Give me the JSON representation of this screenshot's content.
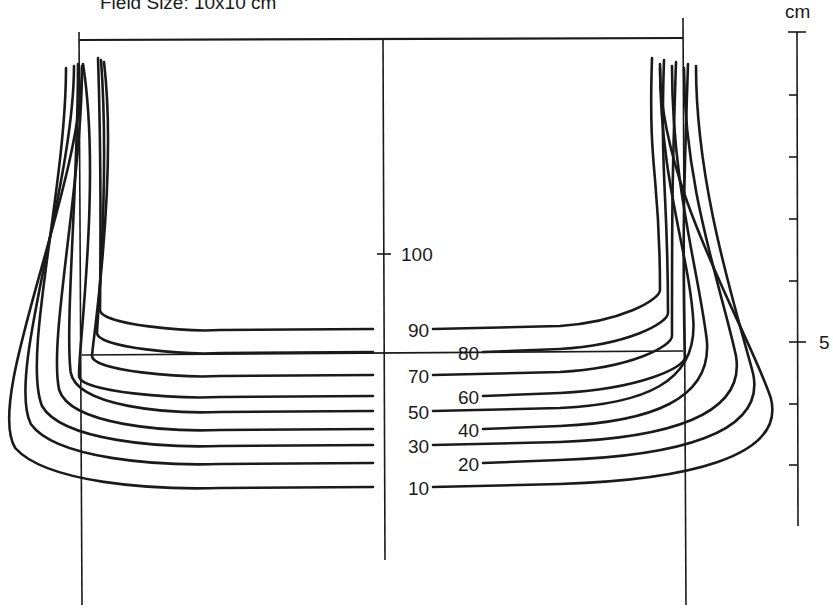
{
  "title": "Field Size:   10x10 cm",
  "scale": {
    "unit_label": "cm",
    "mark_label": "5",
    "x": 797,
    "y_top": 32,
    "y_bottom": 526,
    "ticks_y": [
      32,
      95,
      157,
      219,
      281,
      342,
      404,
      465
    ],
    "major_tick_y": 342
  },
  "central_axis": {
    "x": 383,
    "y_top": 40,
    "y_bottom": 560,
    "tick_y": 254,
    "tick_label": "100"
  },
  "field_edges": {
    "left_x": 79,
    "right_x": 683,
    "top_y": 40,
    "left_top_y": 32,
    "right_top_y": 18,
    "bottom_y": 605,
    "depth_line_y": 355
  },
  "isodose_curves": [
    {
      "level": "90",
      "depth_y": 330,
      "label_x": 408,
      "label_side": "axis",
      "outer_left": 100,
      "outer_right": 660,
      "top_y": 58,
      "bow": 0
    },
    {
      "level": "80",
      "depth_y": 353,
      "label_x": 458,
      "label_side": "offset",
      "outer_left": 97,
      "outer_right": 668,
      "top_y": 60,
      "bow": 0
    },
    {
      "level": "70",
      "depth_y": 376,
      "label_x": 408,
      "label_side": "axis",
      "outer_left": 92,
      "outer_right": 672,
      "top_y": 62,
      "bow": 0
    },
    {
      "level": "60",
      "depth_y": 397,
      "label_x": 458,
      "label_side": "offset",
      "outer_left": 84,
      "outer_right": 680,
      "top_y": 64,
      "bow": 8
    },
    {
      "level": "50",
      "depth_y": 412,
      "label_x": 408,
      "label_side": "axis",
      "outer_left": 79,
      "outer_right": 685,
      "top_y": 64,
      "bow": 14
    },
    {
      "level": "40",
      "depth_y": 430,
      "label_x": 458,
      "label_side": "offset",
      "outer_left": 76,
      "outer_right": 690,
      "top_y": 66,
      "bow": 28
    },
    {
      "level": "30",
      "depth_y": 446,
      "label_x": 408,
      "label_side": "axis",
      "outer_left": 72,
      "outer_right": 706,
      "top_y": 68,
      "bow": 50
    },
    {
      "level": "20",
      "depth_y": 464,
      "label_x": 458,
      "label_side": "offset",
      "outer_left": 68,
      "outer_right": 716,
      "top_y": 66,
      "bow": 62
    },
    {
      "level": "10",
      "depth_y": 488,
      "label_x": 408,
      "label_side": "axis",
      "outer_left": 62,
      "outer_right": 724,
      "top_y": 68,
      "bow": 78
    }
  ],
  "chart_data": {
    "type": "isodose-contour",
    "title": "Field Size: 10x10 cm",
    "isodose_levels_percent": [
      100,
      90,
      80,
      70,
      60,
      50,
      40,
      30,
      20,
      10
    ],
    "central_axis_depth_cm": {
      "100": 3.6,
      "90": 4.6,
      "80": 5.0,
      "70": 5.4,
      "60": 5.8,
      "50": 6.0,
      "40": 6.3,
      "30": 6.6,
      "20": 6.9,
      "10": 7.3
    },
    "depth_scale_cm": {
      "range": [
        0,
        8
      ],
      "labeled_ticks": [
        5
      ],
      "unit": "cm"
    }
  }
}
